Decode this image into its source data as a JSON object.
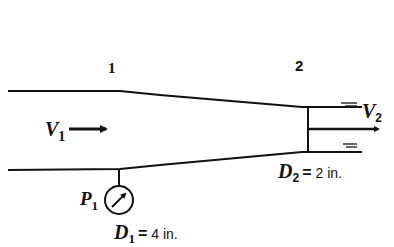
{
  "diagram": {
    "type": "converging-nozzle",
    "section_labels": {
      "section1": "1",
      "section2": "2"
    },
    "inlet_velocity": {
      "symbol": "V",
      "subscript": "1"
    },
    "outlet_velocity": {
      "symbol": "V",
      "subscript": "2"
    },
    "pressure_gauge": {
      "symbol": "P",
      "subscript": "1"
    },
    "inlet_diameter": {
      "symbol": "D",
      "subscript": "1",
      "equals": "=",
      "value": "4 in."
    },
    "outlet_diameter": {
      "symbol": "D",
      "subscript": "2",
      "equals": "=",
      "value": "2 in."
    },
    "colors": {
      "stroke": "#111111",
      "background": "#ffffff"
    }
  }
}
